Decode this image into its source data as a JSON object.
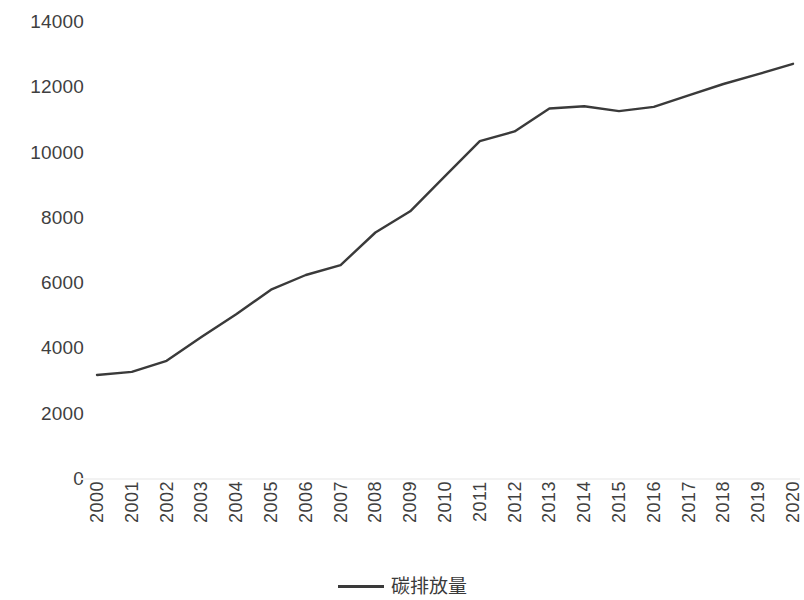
{
  "chart_data": {
    "type": "line",
    "title": "",
    "subtitle": "",
    "xlabel": "",
    "ylabel": "",
    "categories": [
      "2000",
      "2001",
      "2002",
      "2003",
      "2004",
      "2005",
      "2006",
      "2007",
      "2008",
      "2009",
      "2010",
      "2011",
      "2012",
      "2013",
      "2014",
      "2015",
      "2016",
      "2017",
      "2018",
      "2019",
      "2020"
    ],
    "series": [
      {
        "name": "碳排放量",
        "color": "#3a3a3a",
        "values": [
          3185,
          3280,
          3620,
          4350,
          5050,
          5800,
          6250,
          6554,
          7550,
          8200,
          9280,
          10352,
          10650,
          11350,
          11420,
          11270,
          11400,
          11750,
          12100,
          12400,
          12720
        ]
      }
    ],
    "ylim": [
      0,
      14000
    ],
    "y_ticks": [
      0,
      2000,
      4000,
      6000,
      8000,
      10000,
      12000,
      14000
    ],
    "y_tick_labels": [
      "0",
      "2000",
      "4000",
      "6000",
      "8000",
      "10000",
      "12000",
      "14000"
    ],
    "grid": false,
    "legend_position": "bottom",
    "axis_line_color": "#f2f2f2",
    "background": "#ffffff"
  },
  "legend": {
    "entries": [
      {
        "label": "碳排放量",
        "color": "#3a3a3a",
        "marker": "line-swatch"
      }
    ]
  }
}
